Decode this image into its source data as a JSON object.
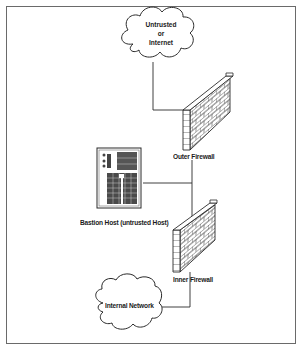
{
  "diagram": {
    "type": "network-topology",
    "nodes": {
      "internet": {
        "label_line1": "Untrusted",
        "label_line2": "or",
        "label_line3": "Internet",
        "shape": "cloud"
      },
      "outer_firewall": {
        "label": "Outer Firewall",
        "shape": "brick-wall"
      },
      "bastion_host": {
        "label": "Bastion Host (untrusted Host)",
        "shape": "server-tower"
      },
      "inner_firewall": {
        "label": "Inner Firewall",
        "shape": "brick-wall"
      },
      "internal_network": {
        "label": "Internal Network",
        "shape": "cloud"
      }
    },
    "edges": [
      {
        "from": "internet",
        "to": "outer_firewall"
      },
      {
        "from": "outer_firewall",
        "to": "inner_firewall"
      },
      {
        "from": "bastion_host",
        "to": "outer_firewall-inner_firewall-link"
      },
      {
        "from": "inner_firewall",
        "to": "internal_network"
      }
    ],
    "colors": {
      "line": "#2a2a2a",
      "frame": "#6a6a6a",
      "background": "#ffffff"
    }
  }
}
